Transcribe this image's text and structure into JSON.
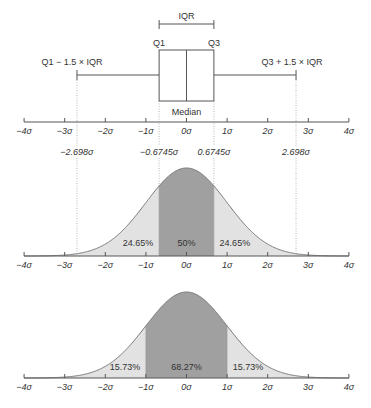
{
  "chart_data": [
    {
      "type": "boxplot",
      "title": "",
      "axis": {
        "min": -4,
        "max": 4,
        "ticks": [
          -4,
          -3,
          -2,
          -1,
          0,
          1,
          2,
          3,
          4
        ],
        "tick_labels": [
          "−4σ",
          "−3σ",
          "−2σ",
          "−1σ",
          "0σ",
          "1σ",
          "2σ",
          "3σ",
          "4σ"
        ]
      },
      "q1": -0.6745,
      "median": 0,
      "q3": 0.6745,
      "whisker_low": -2.698,
      "whisker_high": 2.698,
      "annotations": {
        "iqr": "IQR",
        "q1": "Q1",
        "q3": "Q3",
        "median": "Median",
        "lower_fence": "Q1 − 1.5 × IQR",
        "upper_fence": "Q3 + 1.5 × IQR"
      },
      "marker_labels": [
        {
          "x": -2.698,
          "label": "−2.698σ"
        },
        {
          "x": -0.6745,
          "label": "−0.6745σ"
        },
        {
          "x": 0.6745,
          "label": "0.6745σ"
        },
        {
          "x": 2.698,
          "label": "2.698σ"
        }
      ]
    },
    {
      "type": "area",
      "title": "Normal distribution — IQR regions",
      "xlim": [
        -4,
        4
      ],
      "tick_labels": [
        "−4σ",
        "−3σ",
        "−2σ",
        "−1σ",
        "0σ",
        "1σ",
        "2σ",
        "3σ",
        "4σ"
      ],
      "regions": [
        {
          "from": -4,
          "to": -0.6745,
          "label": "24.65%",
          "shade": "light"
        },
        {
          "from": -0.6745,
          "to": 0.6745,
          "label": "50%",
          "shade": "dark"
        },
        {
          "from": 0.6745,
          "to": 4,
          "label": "24.65%",
          "shade": "light"
        }
      ]
    },
    {
      "type": "area",
      "title": "Normal distribution — ±1σ regions",
      "xlim": [
        -4,
        4
      ],
      "tick_labels": [
        "−4σ",
        "−3σ",
        "−2σ",
        "−1σ",
        "0σ",
        "1σ",
        "2σ",
        "3σ",
        "4σ"
      ],
      "regions": [
        {
          "from": -4,
          "to": -1,
          "label": "15.73%",
          "shade": "light"
        },
        {
          "from": -1,
          "to": 1,
          "label": "68.27%",
          "shade": "dark"
        },
        {
          "from": 1,
          "to": 4,
          "label": "15.73%",
          "shade": "light"
        }
      ]
    }
  ],
  "colors": {
    "text": "#333333",
    "axis": "#555555",
    "curve": "#777777",
    "light_fill": "#e2e2e2",
    "dark_fill": "#a0a0a0",
    "guide": "#999999"
  }
}
